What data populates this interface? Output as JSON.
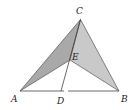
{
  "diagram": {
    "type": "geometry",
    "points": {
      "A": {
        "label": "A",
        "x": 20,
        "y": 91
      },
      "B": {
        "label": "B",
        "x": 119,
        "y": 91
      },
      "C": {
        "label": "C",
        "x": 80.5,
        "y": 19.5
      },
      "D": {
        "label": "D",
        "x": 61,
        "y": 91
      },
      "E": {
        "label": "E",
        "x": 70,
        "y": 60
      }
    },
    "shaded_regions": [
      {
        "name": "triangle-ACE",
        "vertices": [
          "A",
          "C",
          "E"
        ],
        "color": "#a9a9a9"
      },
      {
        "name": "triangle-BCE",
        "vertices": [
          "B",
          "C",
          "E"
        ],
        "color": "#c9c9c9"
      }
    ],
    "segments": [
      [
        "A",
        "B"
      ],
      [
        "A",
        "C"
      ],
      [
        "B",
        "C"
      ],
      [
        "A",
        "E"
      ],
      [
        "B",
        "E"
      ],
      [
        "C",
        "D"
      ]
    ],
    "labels": {
      "A": "A",
      "B": "B",
      "C": "C",
      "D": "D",
      "E": "E"
    }
  }
}
